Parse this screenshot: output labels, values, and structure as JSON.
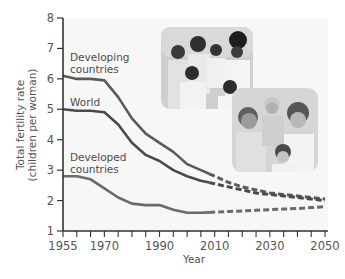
{
  "chart_data": {
    "type": "line",
    "title": "",
    "xlabel": "Year",
    "ylabel": "Total fertility rate (children per woman)",
    "ylabel_lines": [
      "Total fertility rate",
      "(children per woman)"
    ],
    "xlim": [
      1955,
      2050
    ],
    "ylim": [
      1,
      8
    ],
    "x_ticks": [
      1955,
      1970,
      1990,
      2010,
      2030,
      2050
    ],
    "x_minor_step": 5,
    "y_ticks": [
      1,
      2,
      3,
      4,
      5,
      6,
      7,
      8
    ],
    "grid": false,
    "legend": "inline labels",
    "projection_start": 2008,
    "x": [
      1955,
      1960,
      1965,
      1970,
      1975,
      1980,
      1985,
      1990,
      1995,
      2000,
      2005,
      2010,
      2015,
      2020,
      2025,
      2030,
      2035,
      2040,
      2045,
      2050
    ],
    "series": [
      {
        "name": "Developing countries",
        "label_lines": [
          "Developing",
          "countries"
        ],
        "color": "#5a5a5a",
        "values": [
          6.1,
          6.0,
          6.0,
          5.95,
          5.4,
          4.7,
          4.2,
          3.9,
          3.6,
          3.2,
          3.0,
          2.8,
          2.6,
          2.45,
          2.35,
          2.25,
          2.2,
          2.15,
          2.1,
          2.05
        ]
      },
      {
        "name": "World",
        "label_lines": [
          "World"
        ],
        "color": "#4a4a4a",
        "values": [
          5.0,
          4.95,
          4.95,
          4.9,
          4.5,
          3.9,
          3.5,
          3.3,
          3.0,
          2.8,
          2.65,
          2.55,
          2.45,
          2.35,
          2.25,
          2.2,
          2.15,
          2.1,
          2.05,
          2.0
        ]
      },
      {
        "name": "Developed countries",
        "label_lines": [
          "Developed",
          "countries"
        ],
        "color": "#6a6a6a",
        "values": [
          2.8,
          2.8,
          2.7,
          2.4,
          2.1,
          1.9,
          1.85,
          1.85,
          1.7,
          1.6,
          1.6,
          1.62,
          1.64,
          1.66,
          1.68,
          1.7,
          1.72,
          1.74,
          1.77,
          1.8
        ]
      }
    ],
    "annotations": [
      {
        "type": "photo",
        "description": "family photo (developing country family)"
      },
      {
        "type": "photo",
        "description": "family photo (developed country family)"
      }
    ]
  }
}
